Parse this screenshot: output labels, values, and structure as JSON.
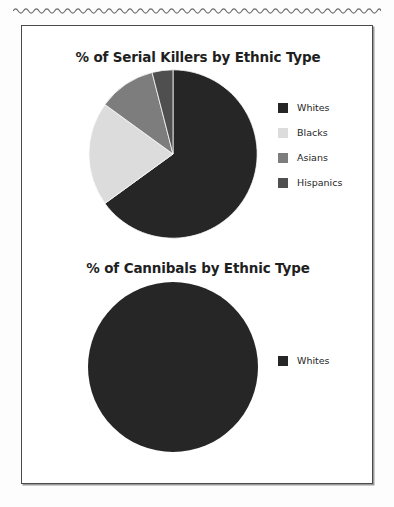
{
  "page": {
    "background_color": "#ffffff",
    "frame_border_color": "#4a4a4a",
    "decor": {
      "name": "wavy-torn-edge",
      "color": "#6b6b6b"
    }
  },
  "palette": {
    "whites": "#262626",
    "blacks": "#dcdcdc",
    "asians": "#7d7d7d",
    "hispanics": "#4f4f4f",
    "text": "#1f1f1f"
  },
  "charts": [
    {
      "id": "serial-killers",
      "title": "% of Serial Killers by Ethnic Type",
      "legend": [
        {
          "label": "Whites",
          "color": "#262626"
        },
        {
          "label": "Blacks",
          "color": "#dcdcdc"
        },
        {
          "label": "Asians",
          "color": "#7d7d7d"
        },
        {
          "label": "Hispanics",
          "color": "#4f4f4f"
        }
      ]
    },
    {
      "id": "cannibals",
      "title": "% of Cannibals by Ethnic Type",
      "legend": [
        {
          "label": "Whites",
          "color": "#262626"
        }
      ]
    }
  ],
  "chart_data": [
    {
      "type": "pie",
      "title": "% of Serial Killers by Ethnic Type",
      "xlabel": "",
      "ylabel": "",
      "legend_position": "right",
      "start_angle_deg": 0,
      "direction": "clockwise",
      "categories": [
        "Whites",
        "Blacks",
        "Asians",
        "Hispanics"
      ],
      "values": [
        65,
        20,
        11,
        4
      ],
      "colors": [
        "#262626",
        "#dcdcdc",
        "#7d7d7d",
        "#4f4f4f"
      ]
    },
    {
      "type": "pie",
      "title": "% of Cannibals by Ethnic Type",
      "xlabel": "",
      "ylabel": "",
      "legend_position": "right",
      "start_angle_deg": 0,
      "direction": "clockwise",
      "categories": [
        "Whites"
      ],
      "values": [
        100
      ],
      "colors": [
        "#262626"
      ]
    }
  ]
}
